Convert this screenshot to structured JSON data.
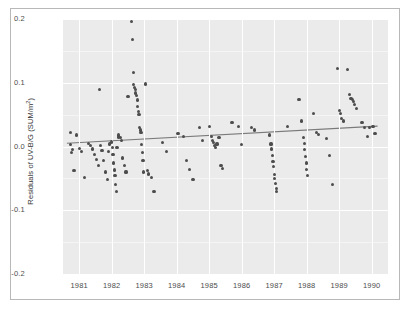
{
  "figure": {
    "background_color": "#ffffff",
    "frame_color": "#b8b8b8",
    "panel_color": "#ebebeb",
    "grid_color": "#ffffff",
    "point_color": "#4d4d4d",
    "trendline_color": "#7a7a7a"
  },
  "axis": {
    "ylabel_prefix": "Residuals of UV-B/G (SUM/m",
    "ylabel_sup": "2",
    "ylabel_suffix": ")",
    "ylabel_full": "Residuals of UV-B/G (SUM/m2)",
    "ytick_labels": [
      "0.2",
      "0.1",
      "0.0",
      "-0.1",
      "-0.2"
    ],
    "xtick_labels": [
      "1981",
      "1982",
      "1983",
      "1984",
      "1985",
      "1986",
      "1987",
      "1988",
      "1989",
      "1990"
    ]
  },
  "chart_data": {
    "type": "scatter",
    "title": "",
    "xlabel": "",
    "ylabel": "Residuals of UV-B/G (SUM/m2)",
    "xlim": [
      1980.5,
      1990.5
    ],
    "ylim": [
      -0.2,
      0.2
    ],
    "yticks": [
      0.2,
      0.1,
      0.0,
      -0.1,
      -0.2
    ],
    "xticks": [
      1981,
      1982,
      1983,
      1984,
      1985,
      1986,
      1987,
      1988,
      1989,
      1990
    ],
    "grid": true,
    "legend": "none",
    "series": [
      {
        "name": "Residuals",
        "marker": "circle",
        "color": "#4d4d4d",
        "points": [
          [
            1980.72,
            0.022
          ],
          [
            1980.74,
            0.003
          ],
          [
            1980.76,
            -0.01
          ],
          [
            1980.8,
            -0.005
          ],
          [
            1980.84,
            -0.038
          ],
          [
            1980.92,
            0.018
          ],
          [
            1981.02,
            -0.003
          ],
          [
            1981.08,
            -0.008
          ],
          [
            1981.16,
            -0.048
          ],
          [
            1981.28,
            0.005
          ],
          [
            1981.34,
            0.001
          ],
          [
            1981.4,
            -0.004
          ],
          [
            1981.46,
            -0.013
          ],
          [
            1981.52,
            -0.02
          ],
          [
            1981.58,
            -0.03
          ],
          [
            1981.62,
            0.089
          ],
          [
            1981.66,
            0.002
          ],
          [
            1981.7,
            -0.006
          ],
          [
            1981.74,
            -0.022
          ],
          [
            1981.8,
            -0.04
          ],
          [
            1981.86,
            -0.052
          ],
          [
            1981.9,
            -0.008
          ],
          [
            1981.94,
            0.004
          ],
          [
            1982.0,
            0.007
          ],
          [
            1982.02,
            -0.001
          ],
          [
            1982.04,
            -0.012
          ],
          [
            1982.06,
            -0.026
          ],
          [
            1982.08,
            -0.037
          ],
          [
            1982.1,
            -0.045
          ],
          [
            1982.12,
            -0.06
          ],
          [
            1982.14,
            -0.07
          ],
          [
            1982.16,
            -0.002
          ],
          [
            1982.2,
            0.015
          ],
          [
            1982.22,
            0.018
          ],
          [
            1982.26,
            0.014
          ],
          [
            1982.3,
            0.009
          ],
          [
            1982.34,
            -0.018
          ],
          [
            1982.38,
            -0.03
          ],
          [
            1982.44,
            -0.04
          ],
          [
            1982.5,
            0.078
          ],
          [
            1982.62,
            0.196
          ],
          [
            1982.64,
            0.168
          ],
          [
            1982.66,
            0.116
          ],
          [
            1982.68,
            0.097
          ],
          [
            1982.7,
            0.093
          ],
          [
            1982.72,
            0.09
          ],
          [
            1982.74,
            0.084
          ],
          [
            1982.76,
            0.08
          ],
          [
            1982.78,
            0.073
          ],
          [
            1982.8,
            0.063
          ],
          [
            1982.82,
            0.055
          ],
          [
            1982.84,
            0.05
          ],
          [
            1982.86,
            0.03
          ],
          [
            1982.88,
            0.026
          ],
          [
            1982.9,
            0.022
          ],
          [
            1982.92,
            0.003
          ],
          [
            1982.94,
            -0.01
          ],
          [
            1982.96,
            -0.022
          ],
          [
            1982.98,
            -0.04
          ],
          [
            1983.04,
            0.098
          ],
          [
            1983.1,
            -0.038
          ],
          [
            1983.14,
            -0.043
          ],
          [
            1983.22,
            -0.048
          ],
          [
            1983.3,
            -0.07
          ],
          [
            1983.56,
            0.006
          ],
          [
            1983.68,
            -0.008
          ],
          [
            1984.04,
            0.02
          ],
          [
            1984.2,
            0.016
          ],
          [
            1984.3,
            -0.022
          ],
          [
            1984.4,
            -0.036
          ],
          [
            1984.5,
            -0.052
          ],
          [
            1984.7,
            0.03
          ],
          [
            1984.8,
            0.01
          ],
          [
            1985.02,
            0.031
          ],
          [
            1985.06,
            0.016
          ],
          [
            1985.1,
            0.01
          ],
          [
            1985.12,
            0.006
          ],
          [
            1985.16,
            0.002
          ],
          [
            1985.2,
            -0.002
          ],
          [
            1985.24,
            0.004
          ],
          [
            1985.3,
            0.014
          ],
          [
            1985.36,
            -0.03
          ],
          [
            1985.42,
            -0.034
          ],
          [
            1985.7,
            0.038
          ],
          [
            1985.9,
            0.031
          ],
          [
            1986.0,
            0.003
          ],
          [
            1986.3,
            0.03
          ],
          [
            1986.4,
            0.026
          ],
          [
            1986.86,
            0.018
          ],
          [
            1986.9,
            0.004
          ],
          [
            1986.92,
            -0.004
          ],
          [
            1986.94,
            -0.014
          ],
          [
            1986.96,
            -0.024
          ],
          [
            1986.98,
            -0.032
          ],
          [
            1987.0,
            -0.044
          ],
          [
            1987.02,
            -0.05
          ],
          [
            1987.04,
            -0.058
          ],
          [
            1987.06,
            -0.066
          ],
          [
            1987.08,
            -0.07
          ],
          [
            1987.4,
            0.031
          ],
          [
            1987.76,
            0.074
          ],
          [
            1987.84,
            0.04
          ],
          [
            1987.9,
            0.014
          ],
          [
            1987.92,
            0.005
          ],
          [
            1987.94,
            -0.005
          ],
          [
            1987.96,
            -0.016
          ],
          [
            1987.98,
            -0.026
          ],
          [
            1988.0,
            -0.036
          ],
          [
            1988.02,
            -0.046
          ],
          [
            1988.2,
            0.052
          ],
          [
            1988.3,
            0.022
          ],
          [
            1988.36,
            0.019
          ],
          [
            1988.6,
            0.012
          ],
          [
            1988.7,
            -0.014
          ],
          [
            1988.78,
            -0.06
          ],
          [
            1988.94,
            0.122
          ],
          [
            1989.0,
            0.056
          ],
          [
            1989.04,
            0.052
          ],
          [
            1989.08,
            0.044
          ],
          [
            1989.12,
            0.04
          ],
          [
            1989.26,
            0.121
          ],
          [
            1989.32,
            0.082
          ],
          [
            1989.36,
            0.075
          ],
          [
            1989.4,
            0.074
          ],
          [
            1989.44,
            0.07
          ],
          [
            1989.48,
            0.066
          ],
          [
            1989.52,
            0.06
          ],
          [
            1989.7,
            0.038
          ],
          [
            1989.78,
            0.03
          ],
          [
            1989.86,
            0.016
          ],
          [
            1989.94,
            0.03
          ],
          [
            1990.04,
            0.031
          ],
          [
            1990.1,
            0.02
          ]
        ]
      }
    ],
    "trendline": {
      "name": "Linear fit",
      "color": "#7a7a7a",
      "x_start": 1980.62,
      "y_start": 0.005,
      "x_end": 1990.18,
      "y_end": 0.032
    }
  }
}
